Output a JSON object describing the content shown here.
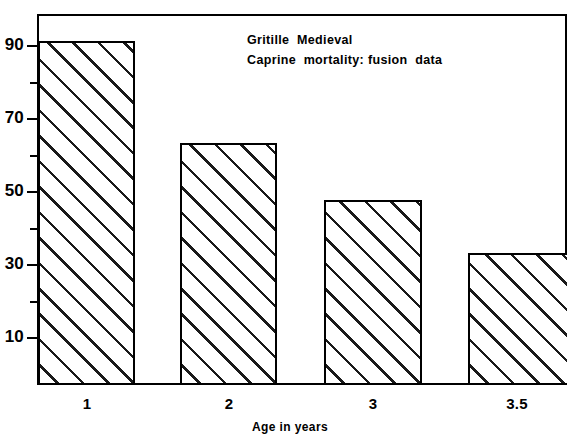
{
  "chart_data": {
    "type": "bar",
    "title": "",
    "annotation_lines": [
      "Gritille  Medieval",
      "Caprine  mortality: fusion  data"
    ],
    "categories": [
      "1",
      "2",
      "3",
      "3.5"
    ],
    "values": [
      91,
      64,
      49,
      35
    ],
    "xlabel": "Age in  years",
    "ylabel": "",
    "ylim": [
      0,
      98
    ],
    "ytick_labels": [
      "90",
      "70",
      "50",
      "30",
      "10"
    ],
    "ytick_values": [
      90,
      70,
      50,
      30,
      10
    ],
    "yminor_values": [
      80,
      60,
      40,
      20
    ],
    "grid": false,
    "legend": false,
    "bar_fill": "hatch-45",
    "bar_edge_color": "#000000",
    "background_color": "#ffffff"
  },
  "axis": {
    "y_label_90": "90",
    "y_label_70": "70",
    "y_label_50": "50",
    "y_label_30": "30",
    "y_label_10": "10",
    "x_label_1": "1",
    "x_label_2": "2",
    "x_label_3": "3",
    "x_label_4": "3.5",
    "x_title": "Age in  years"
  },
  "annotation": {
    "line1": "Gritille  Medieval",
    "line2": "Caprine  mortality: fusion  data"
  }
}
